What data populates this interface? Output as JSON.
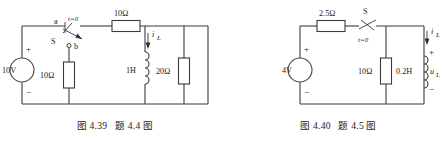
{
  "figures": [
    {
      "id": "fig-4-39",
      "caption": "图 4.39   题 4.4 图",
      "source": {
        "label": "10V",
        "plus": "+",
        "minus": "−"
      },
      "switch": {
        "name": "S",
        "time_label": "t=0",
        "terminal_a": "a",
        "terminal_b": "b"
      },
      "components": [
        {
          "name": "shunt-resistor",
          "label": "10Ω"
        },
        {
          "name": "series-resistor",
          "label": "10Ω"
        },
        {
          "name": "inductor",
          "label": "1H"
        },
        {
          "name": "load-resistor",
          "label": "20Ω"
        }
      ],
      "current": {
        "symbol": "i",
        "subscript": "L"
      }
    },
    {
      "id": "fig-4-40",
      "caption": "图 4.40   题 4.5 图",
      "source": {
        "label": "4V",
        "plus": "+",
        "minus": "−"
      },
      "switch": {
        "name": "S",
        "time_label": "t=0"
      },
      "components": [
        {
          "name": "series-resistor",
          "label": "2.5Ω"
        },
        {
          "name": "shunt-resistor",
          "label": "10Ω"
        },
        {
          "name": "inductor",
          "label": "0.2H"
        }
      ],
      "current": {
        "symbol": "i",
        "subscript": "L"
      },
      "voltage": {
        "symbol": "u",
        "subscript": "L",
        "plus": "+",
        "minus": "−"
      }
    }
  ]
}
